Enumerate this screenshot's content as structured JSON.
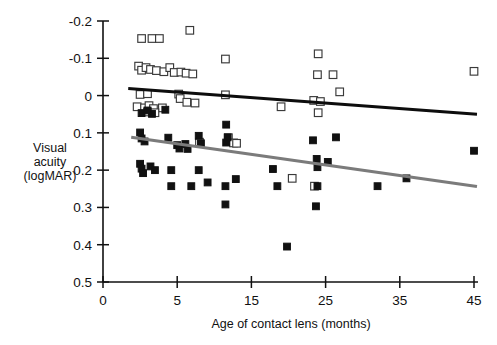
{
  "chart_data": {
    "type": "scatter",
    "title": "",
    "xlabel": "Age of contact lens (months)",
    "ylabel": "Visual acuity (logMAR)",
    "ylabel_lines": [
      "Visual",
      "acuity",
      "(logMAR)"
    ],
    "xticks": [
      0,
      5,
      15,
      25,
      35,
      45
    ],
    "xtick_labels": [
      "0",
      "5",
      "15",
      "25",
      "35",
      "45"
    ],
    "yticks": [
      -0.2,
      -0.1,
      0,
      0.1,
      0.2,
      0.3,
      0.4,
      0.5
    ],
    "ytick_labels": [
      "-0.2",
      "-0.1",
      "0",
      "0.1",
      "0.2",
      "0.3",
      "0.4",
      "0.5"
    ],
    "xlim": [
      0,
      45
    ],
    "ylim_inverted": [
      -0.2,
      0.5
    ],
    "y_axis_direction": "inverted",
    "grid": false,
    "legend": "none",
    "colors": {
      "open_marker_edge": "#3a3a3a",
      "filled_marker": "#111111",
      "trend_line_open_group": "#0d0d0d",
      "trend_line_filled_group": "#7b7b7b",
      "axis": "#111111",
      "background": "#ffffff"
    },
    "series": [
      {
        "name": "open-squares",
        "marker": "open-square",
        "points": [
          [
            2.6,
            -0.153
          ],
          [
            3.3,
            -0.153
          ],
          [
            3.8,
            -0.153
          ],
          [
            6.7,
            -0.175
          ],
          [
            2.4,
            -0.079
          ],
          [
            2.6,
            -0.068
          ],
          [
            2.9,
            -0.075
          ],
          [
            3.2,
            -0.07
          ],
          [
            3.6,
            -0.067
          ],
          [
            4.1,
            -0.064
          ],
          [
            4.5,
            -0.075
          ],
          [
            4.8,
            -0.062
          ],
          [
            5.5,
            -0.063
          ],
          [
            6.2,
            -0.06
          ],
          [
            7.1,
            -0.058
          ],
          [
            11.5,
            -0.098
          ],
          [
            24.0,
            -0.112
          ],
          [
            23.9,
            -0.056
          ],
          [
            26.0,
            -0.056
          ],
          [
            45.0,
            -0.065
          ],
          [
            26.9,
            -0.01
          ],
          [
            2.5,
            -0.003
          ],
          [
            3.0,
            -0.005
          ],
          [
            5.2,
            -0.004
          ],
          [
            5.4,
            0.008
          ],
          [
            11.5,
            -0.002
          ],
          [
            6.3,
            0.018
          ],
          [
            7.4,
            0.02
          ],
          [
            2.3,
            0.03
          ],
          [
            2.8,
            0.033
          ],
          [
            3.1,
            0.027
          ],
          [
            3.4,
            0.035
          ],
          [
            4.0,
            0.033
          ],
          [
            19.0,
            0.03
          ],
          [
            23.4,
            0.013
          ],
          [
            24.3,
            0.016
          ],
          [
            3.0,
            0.044
          ],
          [
            3.5,
            0.046
          ],
          [
            24.0,
            0.046
          ],
          [
            11.9,
            0.113
          ],
          [
            12.6,
            0.127
          ],
          [
            8.0,
            0.125
          ],
          [
            13.0,
            0.128
          ],
          [
            20.5,
            0.222
          ],
          [
            23.5,
            0.243
          ]
        ]
      },
      {
        "name": "filled-squares",
        "marker": "filled-square",
        "points": [
          [
            2.6,
            0.047
          ],
          [
            3.3,
            0.049
          ],
          [
            4.2,
            0.038
          ],
          [
            3.0,
            0.04
          ],
          [
            2.5,
            0.099
          ],
          [
            2.6,
            0.115
          ],
          [
            2.8,
            0.123
          ],
          [
            4.4,
            0.113
          ],
          [
            5.0,
            0.133
          ],
          [
            5.3,
            0.142
          ],
          [
            6.1,
            0.13
          ],
          [
            6.4,
            0.143
          ],
          [
            7.9,
            0.108
          ],
          [
            8.2,
            0.128
          ],
          [
            11.6,
            0.078
          ],
          [
            11.8,
            0.112
          ],
          [
            11.6,
            0.126
          ],
          [
            23.3,
            0.12
          ],
          [
            26.4,
            0.112
          ],
          [
            23.8,
            0.17
          ],
          [
            25.3,
            0.178
          ],
          [
            23.9,
            0.192
          ],
          [
            35.9,
            0.222
          ],
          [
            2.5,
            0.183
          ],
          [
            2.6,
            0.196
          ],
          [
            2.7,
            0.208
          ],
          [
            3.2,
            0.19
          ],
          [
            3.5,
            0.2
          ],
          [
            4.6,
            0.2
          ],
          [
            7.9,
            0.2
          ],
          [
            17.9,
            0.197
          ],
          [
            4.6,
            0.243
          ],
          [
            6.9,
            0.243
          ],
          [
            9.1,
            0.233
          ],
          [
            11.5,
            0.243
          ],
          [
            12.9,
            0.224
          ],
          [
            18.5,
            0.243
          ],
          [
            23.9,
            0.243
          ],
          [
            32.0,
            0.243
          ],
          [
            45.0,
            0.148
          ],
          [
            11.5,
            0.292
          ],
          [
            23.7,
            0.297
          ],
          [
            19.8,
            0.405
          ]
        ]
      }
    ],
    "trend_lines": [
      {
        "name": "open-group-trend",
        "color": "#0d0d0d",
        "x_start": 1.7,
        "y_start": -0.019,
        "x_end": 45.4,
        "y_end": 0.05
      },
      {
        "name": "filled-group-trend",
        "color": "#7b7b7b",
        "x_start": 1.9,
        "y_start": 0.112,
        "x_end": 45.4,
        "y_end": 0.244
      }
    ]
  }
}
